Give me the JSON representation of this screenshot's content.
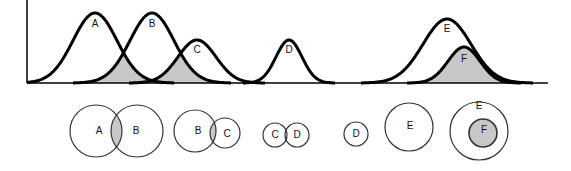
{
  "colors": {
    "stroke": "#000000",
    "overlap_fill": "#c8c8c8",
    "background": "#ffffff"
  },
  "curves": {
    "baseline_y": 83,
    "axis": {
      "x0": 27,
      "x1": 548,
      "y_top": 0
    },
    "items": [
      {
        "label": "A",
        "peak_x": 95,
        "peak_y": 13,
        "sigma": 22,
        "label_y": 24
      },
      {
        "label": "B",
        "peak_x": 152,
        "peak_y": 13,
        "sigma": 22,
        "label_y": 24
      },
      {
        "label": "C",
        "peak_x": 197,
        "peak_y": 40,
        "sigma": 19,
        "label_y": 50
      },
      {
        "label": "D",
        "peak_x": 289,
        "peak_y": 40,
        "sigma": 13,
        "label_y": 50
      },
      {
        "label": "E",
        "peak_x": 447,
        "peak_y": 19,
        "sigma": 24,
        "label_y": 29
      },
      {
        "label": "F",
        "peak_x": 464,
        "peak_y": 47,
        "sigma": 16,
        "label_y": 59
      }
    ],
    "shaded_regions": [
      "A∩B",
      "B∩C",
      "F"
    ]
  },
  "venn": [
    {
      "id": "ab",
      "circles": [
        {
          "label": "A",
          "cx": 96,
          "cy": 131,
          "r": 26,
          "lx": 99,
          "ly": 131
        },
        {
          "label": "B",
          "cx": 137,
          "cy": 131,
          "r": 26,
          "lx": 136,
          "ly": 131
        }
      ],
      "overlap_shaded": true
    },
    {
      "id": "bc",
      "circles": [
        {
          "label": "B",
          "cx": 195,
          "cy": 131,
          "r": 21,
          "lx": 198,
          "ly": 131
        },
        {
          "label": "C",
          "cx": 225,
          "cy": 133,
          "r": 15,
          "lx": 227,
          "ly": 134
        }
      ],
      "overlap_shaded": true
    },
    {
      "id": "cd",
      "circles": [
        {
          "label": "C",
          "cx": 275,
          "cy": 135,
          "r": 12,
          "lx": 275,
          "ly": 135
        },
        {
          "label": "D",
          "cx": 297,
          "cy": 135,
          "r": 12,
          "lx": 297,
          "ly": 135
        }
      ],
      "overlap_shaded": false
    },
    {
      "id": "d",
      "circles": [
        {
          "label": "D",
          "cx": 356,
          "cy": 134,
          "r": 12,
          "lx": 356,
          "ly": 134
        }
      ],
      "overlap_shaded": false
    },
    {
      "id": "e",
      "circles": [
        {
          "label": "E",
          "cx": 409,
          "cy": 127,
          "r": 24,
          "lx": 410,
          "ly": 126
        }
      ],
      "overlap_shaded": false
    },
    {
      "id": "ef",
      "circles": [
        {
          "label": "E",
          "cx": 479,
          "cy": 131,
          "r": 29,
          "lx": 479,
          "ly": 106
        },
        {
          "label": "F",
          "cx": 483,
          "cy": 133,
          "r": 14,
          "lx": 484,
          "ly": 130,
          "filled": true
        }
      ],
      "overlap_shaded": false
    }
  ]
}
